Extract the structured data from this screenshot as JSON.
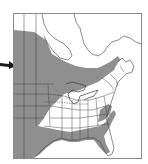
{
  "map": {
    "title": "Species range map, eastern North America",
    "region": "Eastern North America",
    "legend": {
      "range_color": "#8f8f8f",
      "land_color": "#ffffff",
      "border_color": "#3a3a3a"
    },
    "pointer": {
      "icon": "arrow-right-icon",
      "color": "#1a1a1a"
    }
  }
}
